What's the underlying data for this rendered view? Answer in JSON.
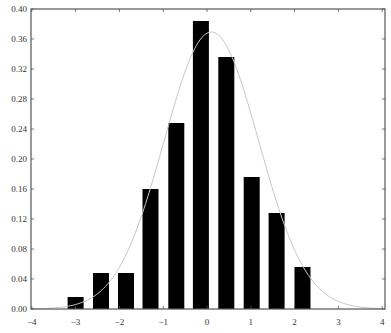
{
  "chart_data": {
    "type": "bar",
    "subtype": "histogram-with-density-curve",
    "title": "",
    "xlabel": "",
    "ylabel": "",
    "xlim": [
      -4,
      4
    ],
    "ylim": [
      0,
      0.4
    ],
    "grid": false,
    "legend": null,
    "x_ticks": [
      -4,
      -3,
      -2,
      -1,
      0,
      1,
      2,
      3,
      4
    ],
    "x_tick_labels": [
      "−4",
      "−3",
      "−2",
      "−1",
      "0",
      "1",
      "2",
      "3",
      "4"
    ],
    "y_ticks": [
      0.0,
      0.04,
      0.08,
      0.12,
      0.16,
      0.2,
      0.24,
      0.28,
      0.32,
      0.36,
      0.4
    ],
    "y_tick_labels": [
      "0.00",
      "0.04",
      "0.08",
      "0.12",
      "0.16",
      "0.20",
      "0.24",
      "0.28",
      "0.32",
      "0.36",
      "0.40"
    ],
    "bar_width": 0.36,
    "categories": [
      -3.0,
      -2.42,
      -1.85,
      -1.29,
      -0.7,
      -0.14,
      0.44,
      1.02,
      1.59,
      2.18
    ],
    "values": [
      0.016,
      0.048,
      0.048,
      0.16,
      0.248,
      0.384,
      0.336,
      0.176,
      0.128,
      0.056
    ],
    "series": [
      {
        "name": "histogram",
        "kind": "bar",
        "color": "#000000",
        "x": [
          -3.0,
          -2.42,
          -1.85,
          -1.29,
          -0.7,
          -0.14,
          0.44,
          1.02,
          1.59,
          2.18
        ],
        "values": [
          0.016,
          0.048,
          0.048,
          0.16,
          0.248,
          0.384,
          0.336,
          0.176,
          0.128,
          0.056
        ]
      },
      {
        "name": "normal density",
        "kind": "line",
        "color": "#c8c8c8",
        "mean": 0.1,
        "sd": 1.08,
        "peak": 0.369
      }
    ]
  },
  "colors": {
    "bar": "#000000",
    "curve": "#c8c8c8",
    "frame": "#555555",
    "text": "#333333",
    "background": "#ffffff"
  }
}
